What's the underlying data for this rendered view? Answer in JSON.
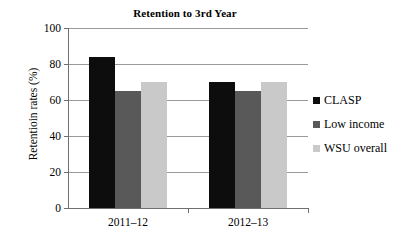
{
  "chart_data": {
    "type": "bar",
    "title": "Retention to 3rd Year",
    "xlabel": "",
    "ylabel": "Retentioin rates (%)",
    "categories": [
      "2011–12",
      "2012–13"
    ],
    "series": [
      {
        "name": "CLASP",
        "values": [
          84,
          70
        ],
        "color": "#0d0d0d"
      },
      {
        "name": "Low income",
        "values": [
          65,
          65
        ],
        "color": "#595959"
      },
      {
        "name": "WSU overall",
        "values": [
          70,
          70
        ],
        "color": "#c9c9c9"
      }
    ],
    "ylim": [
      0,
      100
    ],
    "yticks": [
      0,
      20,
      40,
      60,
      80,
      100
    ],
    "ytick_labels": [
      "0",
      "20",
      "40",
      "60",
      "80",
      "100"
    ],
    "grid": "horizontal",
    "legend_position": "right"
  },
  "legend": {
    "items": [
      {
        "label": "CLASP"
      },
      {
        "label": "Low income"
      },
      {
        "label": "WSU overall"
      }
    ]
  }
}
